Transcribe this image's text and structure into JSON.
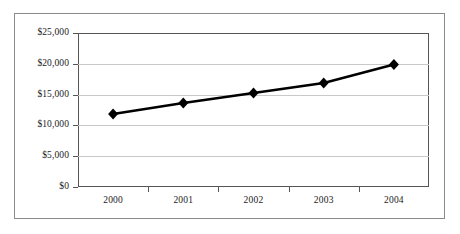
{
  "chart_data": {
    "type": "line",
    "title": "",
    "subtitle": "",
    "xlabel": "",
    "ylabel": "",
    "categories": [
      "2000",
      "2001",
      "2002",
      "2003",
      "2004"
    ],
    "values": [
      11850,
      13640,
      15260,
      16880,
      19890
    ],
    "series": [
      {
        "name": "",
        "values": [
          11850,
          13640,
          15260,
          16880,
          19890
        ]
      }
    ],
    "ylim": [
      0,
      25000
    ],
    "y_ticks": [
      0,
      5000,
      10000,
      15000,
      20000,
      25000
    ],
    "y_tick_labels": [
      "$0",
      "$5,000",
      "$10,000",
      "$15,000",
      "$20,000",
      "$25,000"
    ],
    "x_tick_labels": [
      "2000",
      "2001",
      "2002",
      "2003",
      "2004"
    ],
    "grid": "horizontal",
    "legend": "none",
    "marker": "diamond",
    "line_color": "#000000",
    "marker_color": "#000000",
    "grid_color": "#c9c9c9",
    "axis_color": "#555555",
    "frame_color": "#8a8a8a",
    "background_color": "#ffffff",
    "annotations": []
  }
}
